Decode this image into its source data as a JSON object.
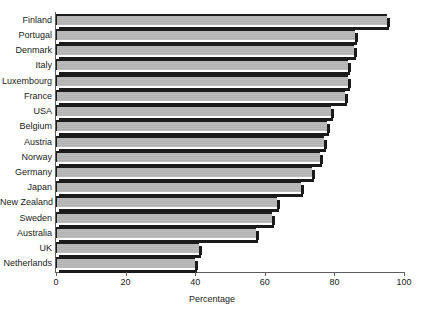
{
  "chart_data": {
    "type": "bar",
    "orientation": "horizontal",
    "title": "",
    "xlabel": "Percentage",
    "ylabel": "",
    "xlim": [
      0,
      100
    ],
    "xticks": [
      0,
      20,
      40,
      60,
      80,
      100
    ],
    "grid": false,
    "legend": null,
    "categories": [
      "Finland",
      "Portugal",
      "Denmark",
      "Italy",
      "Luxembourg",
      "France",
      "USA",
      "Belgium",
      "Austria",
      "Norway",
      "Germany",
      "Japan",
      "New Zealand",
      "Sweden",
      "Australia",
      "UK",
      "Netherlands"
    ],
    "values": [
      95,
      86,
      85.5,
      84,
      84,
      83,
      79,
      78,
      77,
      76,
      73.5,
      70.5,
      63.5,
      62,
      57.5,
      41,
      40
    ]
  },
  "colors": {
    "bar_fill": "#b6b6b6",
    "bar_edge": "#1a1a1a",
    "axis": "#5d5d5d",
    "text": "#222222",
    "background": "#ffffff"
  }
}
